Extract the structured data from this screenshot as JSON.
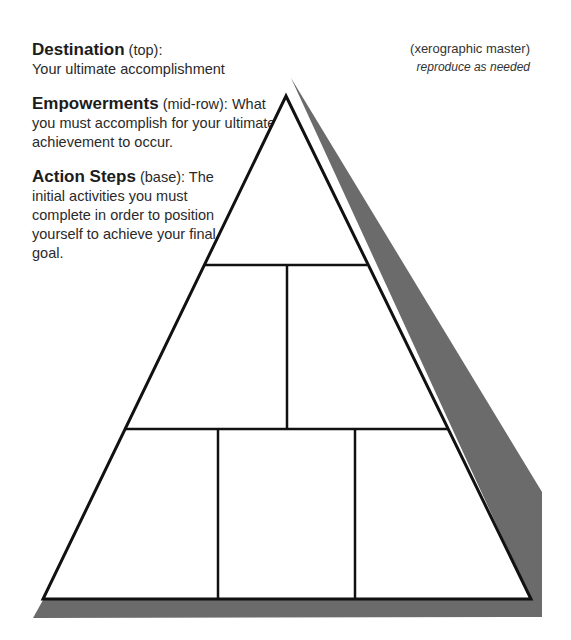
{
  "legend": [
    {
      "term": "Destination",
      "qualifier": "(top):",
      "line1": "",
      "rest": "Your ultimate accomplishment"
    },
    {
      "term": "Empowerments",
      "qualifier": "(mid-row):",
      "line1": " What",
      "rest": "you must accomplish for your ultimate achievement to occur."
    },
    {
      "term": "Action Steps",
      "qualifier": "(base):",
      "line1": " The",
      "rest": "initial activities you must complete in order to position yourself to achieve your final goal."
    }
  ],
  "note": {
    "title": "(xerographic master)",
    "subtitle": "reproduce as needed"
  },
  "pyramid": {
    "rows": [
      {
        "name": "destination",
        "boxes": 1
      },
      {
        "name": "empowerments",
        "boxes": 2
      },
      {
        "name": "action-steps",
        "boxes": 3
      }
    ],
    "colors": {
      "outline": "#111111",
      "shadow": "#6b6b6b",
      "fill": "#ffffff"
    }
  }
}
